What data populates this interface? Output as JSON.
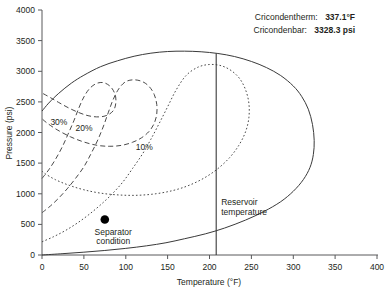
{
  "chart_data": {
    "type": "line",
    "title": "",
    "xlabel": "Temperature (°F)",
    "ylabel": "Pressure (psi)",
    "xlim": [
      0,
      400
    ],
    "ylim": [
      0,
      4000
    ],
    "xticks": [
      0,
      50,
      100,
      150,
      200,
      250,
      300,
      350,
      400
    ],
    "yticks": [
      0,
      500,
      1000,
      1500,
      2000,
      2500,
      3000,
      3500,
      4000
    ],
    "grid": false,
    "legend": "none",
    "series": [
      {
        "name": "Phase envelope",
        "style": "solid",
        "points": [
          [
            0,
            2350
          ],
          [
            8,
            2480
          ],
          [
            20,
            2640
          ],
          [
            35,
            2805
          ],
          [
            50,
            2935
          ],
          [
            70,
            3075
          ],
          [
            90,
            3170
          ],
          [
            110,
            3245
          ],
          [
            130,
            3295
          ],
          [
            150,
            3322
          ],
          [
            170,
            3328
          ],
          [
            190,
            3318
          ],
          [
            210,
            3290
          ],
          [
            230,
            3240
          ],
          [
            250,
            3160
          ],
          [
            268,
            3060
          ],
          [
            285,
            2930
          ],
          [
            300,
            2760
          ],
          [
            310,
            2590
          ],
          [
            318,
            2380
          ],
          [
            323,
            2130
          ],
          [
            325,
            1870
          ],
          [
            324,
            1640
          ],
          [
            320,
            1430
          ],
          [
            312,
            1230
          ],
          [
            300,
            1040
          ],
          [
            285,
            870
          ],
          [
            265,
            710
          ],
          [
            243,
            570
          ],
          [
            218,
            440
          ],
          [
            195,
            345
          ],
          [
            170,
            265
          ],
          [
            148,
            200
          ],
          [
            125,
            150
          ],
          [
            100,
            108
          ],
          [
            75,
            74
          ],
          [
            50,
            46
          ],
          [
            25,
            22
          ],
          [
            0,
            0
          ]
        ]
      },
      {
        "name": "10%",
        "style": "dotted",
        "label": "10%",
        "label_at": [
          112,
          1720
        ],
        "points": [
          [
            0,
            215
          ],
          [
            14,
            300
          ],
          [
            28,
            400
          ],
          [
            42,
            520
          ],
          [
            56,
            660
          ],
          [
            70,
            820
          ],
          [
            84,
            1000
          ],
          [
            97,
            1200
          ],
          [
            108,
            1410
          ],
          [
            120,
            1650
          ],
          [
            130,
            1890
          ],
          [
            140,
            2150
          ],
          [
            150,
            2420
          ],
          [
            160,
            2690
          ],
          [
            172,
            2930
          ],
          [
            186,
            3065
          ],
          [
            200,
            3110
          ],
          [
            214,
            3090
          ],
          [
            226,
            3010
          ],
          [
            236,
            2880
          ],
          [
            243,
            2700
          ],
          [
            247,
            2480
          ],
          [
            247,
            2240
          ],
          [
            243,
            2010
          ],
          [
            235,
            1790
          ],
          [
            224,
            1590
          ],
          [
            210,
            1410
          ],
          [
            194,
            1260
          ],
          [
            176,
            1140
          ],
          [
            157,
            1055
          ],
          [
            136,
            1000
          ],
          [
            114,
            975
          ],
          [
            92,
            980
          ],
          [
            70,
            1010
          ],
          [
            50,
            1065
          ],
          [
            32,
            1140
          ],
          [
            16,
            1230
          ],
          [
            4,
            1325
          ],
          [
            0,
            1370
          ]
        ]
      },
      {
        "name": "20%",
        "style": "dashed",
        "label": "20%",
        "label_at": [
          40,
          2020
        ],
        "points": [
          [
            0,
            690
          ],
          [
            10,
            800
          ],
          [
            20,
            930
          ],
          [
            30,
            1080
          ],
          [
            40,
            1250
          ],
          [
            50,
            1440
          ],
          [
            58,
            1640
          ],
          [
            66,
            1860
          ],
          [
            73,
            2090
          ],
          [
            79,
            2320
          ],
          [
            85,
            2540
          ],
          [
            92,
            2720
          ],
          [
            100,
            2830
          ],
          [
            110,
            2860
          ],
          [
            120,
            2830
          ],
          [
            128,
            2750
          ],
          [
            134,
            2620
          ],
          [
            137,
            2460
          ],
          [
            137,
            2300
          ],
          [
            134,
            2150
          ],
          [
            128,
            2020
          ],
          [
            119,
            1915
          ],
          [
            108,
            1840
          ],
          [
            95,
            1790
          ],
          [
            81,
            1775
          ],
          [
            66,
            1790
          ],
          [
            50,
            1845
          ],
          [
            34,
            1930
          ],
          [
            18,
            2045
          ],
          [
            6,
            2155
          ],
          [
            0,
            2225
          ]
        ]
      },
      {
        "name": "30%",
        "style": "dashed",
        "label": "30%",
        "label_at": [
          10,
          2120
        ],
        "points": [
          [
            0,
            1250
          ],
          [
            8,
            1390
          ],
          [
            16,
            1560
          ],
          [
            24,
            1760
          ],
          [
            31,
            1970
          ],
          [
            38,
            2190
          ],
          [
            44,
            2400
          ],
          [
            50,
            2580
          ],
          [
            57,
            2720
          ],
          [
            65,
            2800
          ],
          [
            73,
            2815
          ],
          [
            80,
            2770
          ],
          [
            85,
            2690
          ],
          [
            88,
            2580
          ],
          [
            88,
            2470
          ],
          [
            86,
            2375
          ],
          [
            81,
            2305
          ],
          [
            74,
            2265
          ],
          [
            65,
            2255
          ],
          [
            55,
            2275
          ],
          [
            44,
            2325
          ],
          [
            32,
            2400
          ],
          [
            20,
            2490
          ],
          [
            10,
            2570
          ],
          [
            2,
            2630
          ],
          [
            0,
            2645
          ]
        ]
      }
    ],
    "points": [
      {
        "name": "separator-condition",
        "label": "Separator\ncondition",
        "label_line1": "Separator",
        "label_line2": "condition",
        "x": 75,
        "y": 580
      }
    ],
    "vlines": [
      {
        "name": "reservoir-temperature",
        "label_line1": "Reservoir",
        "label_line2": "temperature",
        "x": 208,
        "y_top": 3290,
        "y_bottom": 0
      }
    ],
    "annotations": [
      {
        "label": "Cricondentherm:",
        "value": "337.1°F"
      },
      {
        "label": "Cricondenbar:",
        "value": "3328.3 psi"
      }
    ]
  }
}
